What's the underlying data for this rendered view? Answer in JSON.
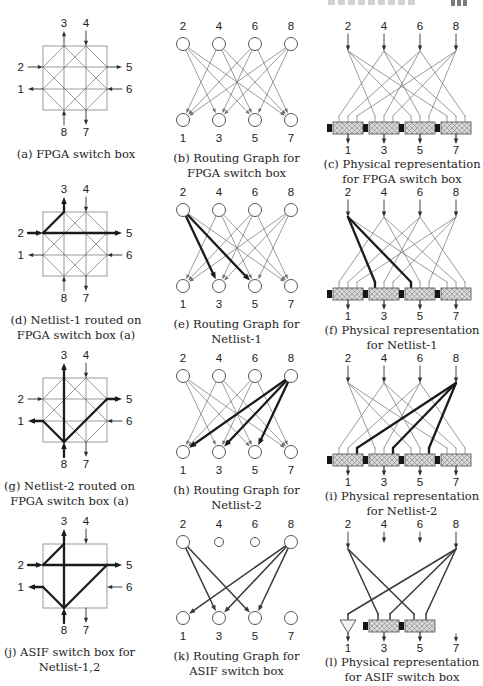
{
  "page": {
    "background": "#ffffff",
    "colors": {
      "ink": "#222222",
      "thin": "#707070",
      "mid": "#3a3a3a",
      "bold": "#1b1b1b",
      "pin": "#2f2f2f",
      "node": "#555555",
      "frame": "#9a9a9a",
      "boxline": "#5e5e5e",
      "mux_fill": "#d9d9d9",
      "mux_hatch": "#8c8c8c",
      "sram": "#161616",
      "buffer_fill": "#f2f2f2",
      "caption": "#1e1e1e"
    }
  },
  "labels": {
    "pins": [
      "1",
      "2",
      "3",
      "4",
      "5",
      "6",
      "7",
      "8"
    ],
    "top": [
      "2",
      "4",
      "6",
      "8"
    ],
    "bottom": [
      "1",
      "3",
      "5",
      "7"
    ]
  },
  "edge_sets": {
    "fpga": [
      [
        2,
        3
      ],
      [
        2,
        5
      ],
      [
        2,
        7
      ],
      [
        4,
        1
      ],
      [
        4,
        5
      ],
      [
        4,
        7
      ],
      [
        6,
        1
      ],
      [
        6,
        3
      ],
      [
        6,
        7
      ],
      [
        8,
        1
      ],
      [
        8,
        3
      ],
      [
        8,
        5
      ]
    ],
    "asif": [
      [
        2,
        3
      ],
      [
        2,
        5
      ],
      [
        8,
        1
      ],
      [
        8,
        3
      ],
      [
        8,
        5
      ]
    ]
  },
  "cells": [
    {
      "id": "a",
      "type": "switchbox",
      "edge_set": "fpga",
      "bold": [],
      "caption": [
        "(a) FPGA switch box"
      ]
    },
    {
      "id": "b",
      "type": "bipartite",
      "edge_set": "fpga",
      "bold": [],
      "caption": [
        "(b) Routing Graph for",
        "FPGA switch box"
      ]
    },
    {
      "id": "c",
      "type": "physical",
      "edge_set": "fpga",
      "bold": [],
      "caption": [
        "(c) Physical representation",
        "for FPGA switch box"
      ]
    },
    {
      "id": "d",
      "type": "switchbox",
      "edge_set": "fpga",
      "bold": [
        [
          2,
          3
        ],
        [
          2,
          5
        ]
      ],
      "caption": [
        "(d) Netlist-1 routed on",
        "FPGA switch box (a)"
      ]
    },
    {
      "id": "e",
      "type": "bipartite",
      "edge_set": "fpga",
      "bold": [
        [
          2,
          3
        ],
        [
          2,
          5
        ]
      ],
      "caption": [
        "(e) Routing Graph for",
        "Netlist-1"
      ]
    },
    {
      "id": "f",
      "type": "physical",
      "edge_set": "fpga",
      "bold": [
        [
          2,
          3
        ],
        [
          2,
          5
        ]
      ],
      "caption": [
        "(f) Physical representation",
        "for Netlist-1"
      ]
    },
    {
      "id": "g",
      "type": "switchbox",
      "edge_set": "fpga",
      "bold": [
        [
          8,
          1
        ],
        [
          8,
          3
        ],
        [
          8,
          5
        ]
      ],
      "caption": [
        "(g) Netlist-2 routed on",
        "FPGA switch box (a)"
      ]
    },
    {
      "id": "h",
      "type": "bipartite",
      "edge_set": "fpga",
      "bold": [
        [
          8,
          1
        ],
        [
          8,
          3
        ],
        [
          8,
          5
        ]
      ],
      "caption": [
        "(h) Routing Graph for",
        "Netlist-2"
      ]
    },
    {
      "id": "i",
      "type": "physical",
      "edge_set": "fpga",
      "bold": [
        [
          8,
          1
        ],
        [
          8,
          3
        ],
        [
          8,
          5
        ]
      ],
      "caption": [
        "(i) Physical representation",
        "for Netlist-2"
      ]
    },
    {
      "id": "j",
      "type": "switchbox",
      "edge_set": "asif",
      "bold": "all",
      "caption": [
        "(j) ASIF switch box for",
        "Netlist-1,2"
      ]
    },
    {
      "id": "k",
      "type": "bipartite",
      "edge_set": "asif",
      "bold": [],
      "weight": "mid",
      "small_top": [
        "4",
        "6"
      ],
      "caption": [
        "(k) Routing Graph for",
        "ASIF switch box"
      ]
    },
    {
      "id": "l",
      "type": "physical",
      "edge_set": "asif",
      "bold": [],
      "weight": "mid",
      "sinks": {
        "1": "buffer",
        "3": "mux",
        "5": "mux",
        "7": "stub"
      },
      "caption": [
        "(l) Physical representation",
        "for ASIF switch box"
      ]
    }
  ]
}
